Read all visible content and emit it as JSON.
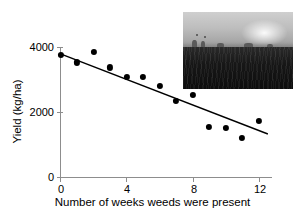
{
  "chart_data": {
    "type": "scatter",
    "title": "",
    "subtitle": "",
    "xlabel": "Number of weeks weeds were present",
    "ylabel": "Yield (kg/ha)",
    "xlim": [
      0,
      12.8
    ],
    "ylim": [
      0,
      4200
    ],
    "grid": false,
    "legend": null,
    "x_ticks": [
      "0",
      "4",
      "8",
      "12"
    ],
    "x_tick_values": [
      0,
      4,
      8,
      12
    ],
    "y_ticks": [
      "0",
      "2000",
      "4000"
    ],
    "y_tick_values": [
      0,
      2000,
      4000
    ],
    "x": [
      0,
      1,
      2,
      3,
      4,
      5,
      6,
      7,
      8,
      9,
      10,
      11,
      12
    ],
    "values": [
      3940,
      3700,
      4030,
      3540,
      3230,
      3230,
      2950,
      2460,
      2650,
      1620,
      1590,
      1250,
      1810
    ],
    "series": [
      {
        "name": "Observed yield",
        "type": "scatter",
        "marker": "filled-circle",
        "color": "#000000",
        "x": [
          0,
          1,
          2,
          3,
          4,
          5,
          6,
          7,
          8,
          9,
          10,
          11,
          12
        ],
        "values": [
          3940,
          3700,
          4030,
          3540,
          3230,
          3230,
          2950,
          2460,
          2650,
          1620,
          1590,
          1250,
          1810
        ]
      },
      {
        "name": "Fitted regression line",
        "type": "line",
        "color": "#000000",
        "x": [
          0,
          12.55
        ],
        "values": [
          3980,
          1390
        ]
      }
    ],
    "annotations": [
      {
        "name": "field-photograph-inset",
        "type": "image",
        "description": "grayscale photograph of a weedy crop field with sky"
      }
    ]
  },
  "axes": {
    "y_title": "Yield (kg/ha)",
    "x_title": "Number of weeks weeds were present",
    "y_tick_labels": [
      "4000",
      "2000",
      "0"
    ],
    "x_tick_labels": [
      "0",
      "4",
      "8",
      "12"
    ]
  }
}
